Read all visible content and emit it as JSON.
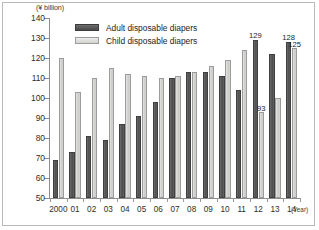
{
  "chart_data": {
    "type": "bar",
    "title": "",
    "subtitle": "",
    "xlabel": "(Year)",
    "ylabel": "(¥ billion)",
    "ylim": [
      50,
      140
    ],
    "yticks": [
      50,
      60,
      70,
      80,
      90,
      100,
      110,
      120,
      130,
      140
    ],
    "grid": false,
    "legend_position": "top-center",
    "categories": [
      "2000",
      "01",
      "02",
      "03",
      "04",
      "05",
      "06",
      "07",
      "08",
      "09",
      "10",
      "11",
      "12",
      "13",
      "14"
    ],
    "series": [
      {
        "name": "Adult disposable diapers",
        "color": "#555555",
        "values": [
          69,
          73,
          81,
          79,
          87,
          91,
          98,
          110,
          113,
          113,
          111,
          104,
          129,
          122,
          128
        ]
      },
      {
        "name": "Child disposable diapers",
        "color": "#d4d4d1",
        "values": [
          120,
          103,
          110,
          115,
          112,
          111,
          110,
          111,
          113,
          116,
          119,
          124,
          93,
          100,
          125
        ]
      }
    ],
    "data_labels": [
      {
        "series": "Adult disposable diapers",
        "category": "12",
        "value": "129"
      },
      {
        "series": "Child disposable diapers",
        "category": "12",
        "value": "93"
      },
      {
        "series": "Adult disposable diapers",
        "category": "14",
        "value": "128"
      },
      {
        "series": "Child disposable diapers",
        "category": "14",
        "value": "125"
      }
    ]
  },
  "legend": {
    "items": [
      {
        "label": "Adult disposable diapers",
        "key": "adult"
      },
      {
        "label": "Child disposable diapers",
        "key": "child"
      }
    ]
  }
}
